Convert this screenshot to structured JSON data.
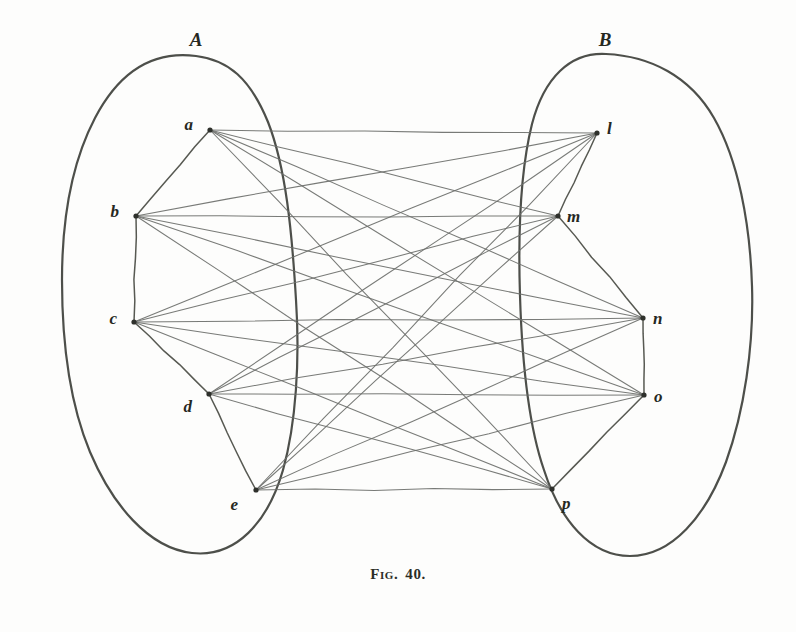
{
  "figure": {
    "caption_prefix": "Fig.",
    "caption_number": "40.",
    "background_color": "#fdfdfc",
    "ink_color": "#3f423c",
    "edge_color": "#6d6f6b",
    "width": 796,
    "height": 632
  },
  "regions": [
    {
      "id": "A",
      "label": "A",
      "label_x": 196,
      "label_y": 46,
      "side": "left",
      "outline": "M 196 56 C 150 50 118 74 95 118 C 72 162 62 220 62 280 C 62 344 70 404 90 452 C 112 504 148 548 192 553 C 236 558 268 522 283 470 C 296 424 300 360 296 300 C 292 232 286 168 268 122 C 250 78 228 60 196 56 Z"
    },
    {
      "id": "B",
      "label": "B",
      "label_x": 605,
      "label_y": 46,
      "side": "right",
      "outline": "M 606 54 C 570 52 544 78 532 124 C 520 172 518 234 520 296 C 522 360 528 424 544 470 C 560 520 590 556 630 556 C 672 556 706 516 726 462 C 744 412 754 346 752 286 C 750 222 738 160 714 118 C 690 76 650 56 606 54 Z"
    }
  ],
  "nodes": [
    {
      "id": "a",
      "label": "a",
      "set": "A",
      "x": 210,
      "y": 130,
      "label_dx": -17,
      "label_dy": -4
    },
    {
      "id": "b",
      "label": "b",
      "set": "A",
      "x": 136,
      "y": 216,
      "label_dx": -17,
      "label_dy": -3
    },
    {
      "id": "c",
      "label": "c",
      "set": "A",
      "x": 134,
      "y": 322,
      "label_dx": -17,
      "label_dy": -2
    },
    {
      "id": "d",
      "label": "d",
      "set": "A",
      "x": 209,
      "y": 394,
      "label_dx": -17,
      "label_dy": 14
    },
    {
      "id": "e",
      "label": "e",
      "set": "A",
      "x": 256,
      "y": 490,
      "label_dx": -18,
      "label_dy": 16
    },
    {
      "id": "l",
      "label": "l",
      "set": "B",
      "x": 597,
      "y": 133,
      "label_dx": 10,
      "label_dy": -3
    },
    {
      "id": "m",
      "label": "m",
      "set": "B",
      "x": 558,
      "y": 216,
      "label_dx": 9,
      "label_dy": 2
    },
    {
      "id": "n",
      "label": "n",
      "set": "B",
      "x": 643,
      "y": 318,
      "label_dx": 10,
      "label_dy": 2
    },
    {
      "id": "o",
      "label": "o",
      "set": "B",
      "x": 644,
      "y": 395,
      "label_dx": 10,
      "label_dy": 3
    },
    {
      "id": "p",
      "label": "p",
      "set": "B",
      "x": 552,
      "y": 489,
      "label_dx": 10,
      "label_dy": 16
    }
  ],
  "polygon_paths": [
    {
      "id": "polygon-A",
      "set": "A",
      "sequence": [
        "a",
        "b",
        "c",
        "d",
        "e"
      ]
    },
    {
      "id": "polygon-B",
      "set": "B",
      "sequence": [
        "l",
        "m",
        "n",
        "o",
        "p"
      ]
    }
  ],
  "edges": [
    {
      "from": "a",
      "to": "l"
    },
    {
      "from": "a",
      "to": "m"
    },
    {
      "from": "a",
      "to": "n"
    },
    {
      "from": "a",
      "to": "o"
    },
    {
      "from": "a",
      "to": "p"
    },
    {
      "from": "b",
      "to": "l"
    },
    {
      "from": "b",
      "to": "m"
    },
    {
      "from": "b",
      "to": "n"
    },
    {
      "from": "b",
      "to": "o"
    },
    {
      "from": "b",
      "to": "p"
    },
    {
      "from": "c",
      "to": "l"
    },
    {
      "from": "c",
      "to": "m"
    },
    {
      "from": "c",
      "to": "n"
    },
    {
      "from": "c",
      "to": "o"
    },
    {
      "from": "c",
      "to": "p"
    },
    {
      "from": "d",
      "to": "l"
    },
    {
      "from": "d",
      "to": "m"
    },
    {
      "from": "d",
      "to": "n"
    },
    {
      "from": "d",
      "to": "o"
    },
    {
      "from": "d",
      "to": "p"
    },
    {
      "from": "e",
      "to": "l"
    },
    {
      "from": "e",
      "to": "m"
    },
    {
      "from": "e",
      "to": "n"
    },
    {
      "from": "e",
      "to": "o"
    },
    {
      "from": "e",
      "to": "p"
    }
  ],
  "chart_data": {
    "type": "diagram",
    "subtype": "complete-bipartite-graph",
    "set_a": [
      "a",
      "b",
      "c",
      "d",
      "e"
    ],
    "set_b": [
      "l",
      "m",
      "n",
      "o",
      "p"
    ],
    "edge_count": 25,
    "node_count": 10
  }
}
